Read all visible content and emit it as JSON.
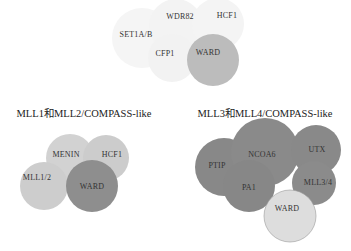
{
  "colors": {
    "faint": "#f4f4f4",
    "light": "#cfcfcf",
    "mid": "#bdbdbd",
    "dark": "#8f8f8f",
    "darker": "#858585",
    "ward_light": "#e0e0e0"
  },
  "top_cluster": {
    "title": "",
    "nodes": [
      {
        "label": "SET1A/B"
      },
      {
        "label": "WDR82"
      },
      {
        "label": "HCF1"
      },
      {
        "label": "CFP1"
      },
      {
        "label": "WARD"
      }
    ]
  },
  "left_cluster": {
    "title": "MLL1和MLL2/COMPASS-like",
    "nodes": [
      {
        "label": "MENIN"
      },
      {
        "label": "HCF1"
      },
      {
        "label": "MLL1/2"
      },
      {
        "label": "WARD"
      }
    ]
  },
  "right_cluster": {
    "title": "MLL3和MLL4/COMPASS-like",
    "nodes": [
      {
        "label": "PTIP"
      },
      {
        "label": "NCOA6"
      },
      {
        "label": "UTX"
      },
      {
        "label": "MLL3/4"
      },
      {
        "label": "PA1"
      },
      {
        "label": "WARD"
      }
    ]
  }
}
